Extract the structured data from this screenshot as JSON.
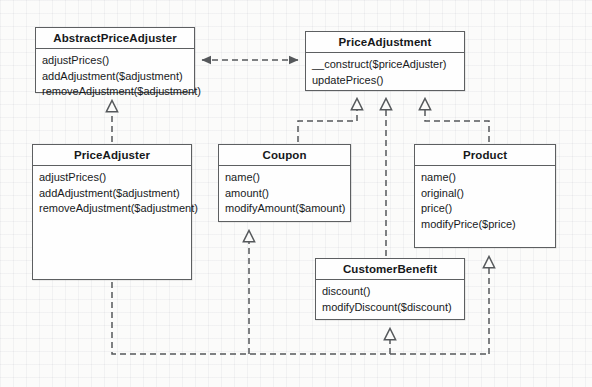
{
  "diagram": {
    "kind": "uml-class-diagram",
    "line_color": "#55585b",
    "box_border_color": "#5d5f61",
    "box_fill": "#fefefe",
    "page_background": "#fbfbfa",
    "classes": [
      {
        "id": "abstract-price-adjuster",
        "name": "AbstractPriceAdjuster",
        "methods": [
          "adjustPrices()",
          "addAdjustment($adjustment)",
          "removeAdjustment($adjustment)"
        ],
        "x": 35,
        "y": 27,
        "width": 160,
        "height": 66
      },
      {
        "id": "price-adjustment",
        "name": "PriceAdjustment",
        "methods": [
          "__construct($priceAdjuster)",
          "updatePrices()"
        ],
        "x": 305,
        "y": 31,
        "width": 160,
        "height": 60
      },
      {
        "id": "price-adjuster",
        "name": "PriceAdjuster",
        "methods": [
          "adjustPrices()",
          "addAdjustment($adjustment)",
          "removeAdjustment($adjustment)"
        ],
        "x": 32,
        "y": 144,
        "width": 160,
        "height": 136
      },
      {
        "id": "coupon",
        "name": "Coupon",
        "methods": [
          "name()",
          "amount()",
          "modifyAmount($amount)"
        ],
        "x": 218,
        "y": 144,
        "width": 133,
        "height": 78
      },
      {
        "id": "product",
        "name": "Product",
        "methods": [
          "name()",
          "original()",
          "price()",
          "modifyPrice($price)"
        ],
        "x": 414,
        "y": 144,
        "width": 142,
        "height": 104
      },
      {
        "id": "customer-benefit",
        "name": "CustomerBenefit",
        "methods": [
          "discount()",
          "modifyDiscount($discount)"
        ],
        "x": 315,
        "y": 258,
        "width": 150,
        "height": 62
      }
    ],
    "relations": [
      {
        "from": "price-adjustment",
        "to": "abstract-price-adjuster",
        "type": "dependency-bidirectional"
      },
      {
        "from": "price-adjuster",
        "to": "abstract-price-adjuster",
        "type": "realization"
      },
      {
        "from": "coupon",
        "to": "price-adjustment",
        "type": "realization"
      },
      {
        "from": "customer-benefit",
        "to": "price-adjustment",
        "type": "realization"
      },
      {
        "from": "product",
        "to": "price-adjustment",
        "type": "realization"
      },
      {
        "from": "price-adjuster",
        "to": "coupon",
        "type": "realization"
      },
      {
        "from": "price-adjuster",
        "to": "customer-benefit",
        "type": "realization"
      },
      {
        "from": "price-adjuster",
        "to": "product",
        "type": "realization"
      }
    ]
  }
}
